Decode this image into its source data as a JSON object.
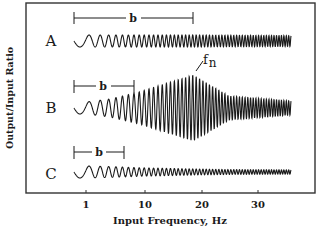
{
  "chart_data": {
    "type": "line",
    "title": "",
    "xlabel": "Input Frequency, Hz",
    "ylabel": "Output/Input Ratio",
    "x_ticks": [
      "1",
      "10",
      "20",
      "30"
    ],
    "x_tick_values": [
      1,
      10,
      20,
      30
    ],
    "xlim": [
      0,
      36
    ],
    "grid": false,
    "legend": "none",
    "series": [
      {
        "name": "A",
        "label": "A",
        "description": "Constant-amplitude response; frequency sweep from ~0.5 Hz to ~35 Hz",
        "bracket_label": "b",
        "bracket_range_hz": [
          0.5,
          19
        ],
        "relative_amplitude": [
          1.0,
          1.0,
          1.0,
          1.0,
          0.95,
          0.9
        ]
      },
      {
        "name": "B",
        "label": "B",
        "description": "Resonant amplification peaking at natural frequency fn (~19 Hz), then attenuating",
        "bracket_label": "b",
        "bracket_range_hz": [
          0.5,
          8
        ],
        "peak_label": "fn",
        "peak_frequency_hz": 19,
        "relative_amplitude": [
          1.0,
          1.5,
          2.7,
          5.5,
          2.0,
          1.2
        ]
      },
      {
        "name": "C",
        "label": "C",
        "description": "Attenuating response; amplitude decreases with frequency",
        "bracket_label": "b",
        "bracket_range_hz": [
          0.5,
          6
        ],
        "relative_amplitude": [
          1.0,
          0.9,
          0.7,
          0.5,
          0.4,
          0.35
        ]
      }
    ],
    "amplitude_sample_freqs_hz": [
      1,
      5,
      10,
      19,
      25,
      35
    ],
    "annotations": [
      {
        "text": "b",
        "series": "A"
      },
      {
        "text": "b",
        "series": "B"
      },
      {
        "text": "b",
        "series": "C"
      },
      {
        "text": "fn",
        "series": "B",
        "note": "natural frequency at peak"
      }
    ]
  },
  "labels": {
    "row_a": "A",
    "row_b": "B",
    "row_c": "C",
    "bracket": "b",
    "fn_main": "f",
    "fn_sub": "n",
    "xlabel": "Input Frequency, Hz",
    "ylabel": "Output/Input Ratio",
    "ticks": [
      "1",
      "10",
      "20",
      "30"
    ]
  },
  "colors": {
    "ink": "#1a1a1a",
    "frame": "#333333",
    "background": "#ffffff"
  }
}
